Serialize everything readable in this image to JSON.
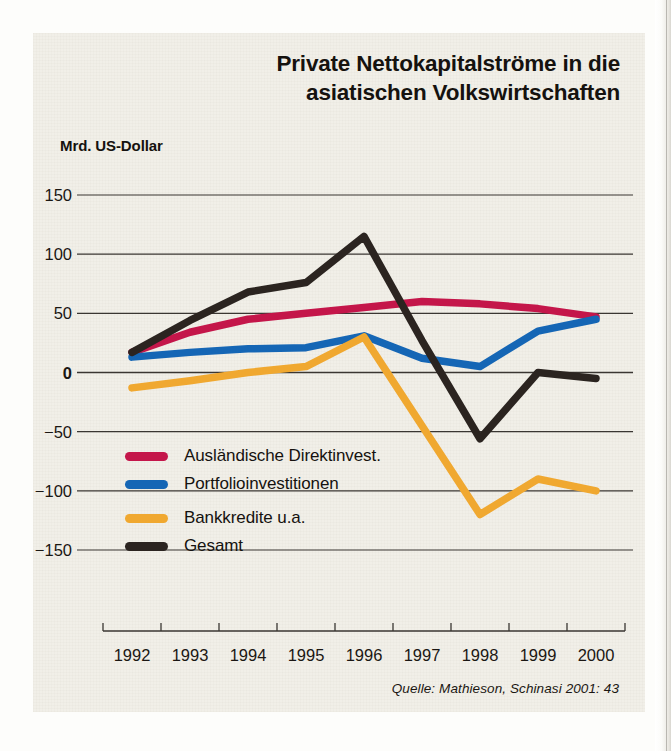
{
  "title": "Private Nettokapitalströme in die asiatischen Volkswirtschaften",
  "title_line1": "Private Nettokapitalströme in die",
  "title_line2": "asiatischen Volkswirtschaften",
  "axis_unit_label": "Mrd. US-Dollar",
  "source_note": "Quelle: Mathieson, Schinasi 2001: 43",
  "colors": {
    "fdi": "#c4164a",
    "portfolio": "#1566b5",
    "bank": "#f0a830",
    "total": "#2b2420",
    "gridline": "#3a3632",
    "panel_background": "#f1efe8",
    "text": "#15120f"
  },
  "chart_data": {
    "type": "line",
    "title": "Private Nettokapitalströme in die asiatischen Volkswirtschaften",
    "xlabel": "",
    "ylabel": "Mrd. US-Dollar",
    "x": [
      1992,
      1993,
      1994,
      1995,
      1996,
      1997,
      1998,
      1999,
      2000
    ],
    "categories": [
      "1992",
      "1993",
      "1994",
      "1995",
      "1996",
      "1997",
      "1998",
      "1999",
      "2000"
    ],
    "ylim": [
      -150,
      150
    ],
    "yticks": [
      150,
      100,
      50,
      0,
      -50,
      -100,
      -150
    ],
    "ytick_labels": [
      "150",
      "100",
      "50",
      "0",
      "−50",
      "−100",
      "−150"
    ],
    "grid": true,
    "legend_position": "inside-lower-left",
    "series": [
      {
        "name": "Ausländische Direktinvest.",
        "color": "#c4164a",
        "values": [
          17,
          34,
          45,
          50,
          55,
          60,
          58,
          54,
          47
        ]
      },
      {
        "name": "Portfolioinvestitionen",
        "color": "#1566b5",
        "values": [
          13,
          17,
          20,
          21,
          31,
          12,
          5,
          35,
          45
        ]
      },
      {
        "name": "Bankkredite u.a.",
        "color": "#f0a830",
        "values": [
          -13,
          -7,
          0,
          5,
          30,
          -45,
          -120,
          -90,
          -100
        ]
      },
      {
        "name": "Gesamt",
        "color": "#2b2420",
        "values": [
          17,
          44,
          68,
          76,
          115,
          27,
          -56,
          0,
          -5
        ]
      }
    ]
  },
  "legend": [
    {
      "label": "Ausländische Direktinvest.",
      "color": "#c4164a"
    },
    {
      "label": "Portfolioinvestitionen",
      "color": "#1566b5"
    },
    {
      "label": "Bankkredite u.a.",
      "color": "#f0a830"
    },
    {
      "label": "Gesamt",
      "color": "#2b2420"
    }
  ]
}
